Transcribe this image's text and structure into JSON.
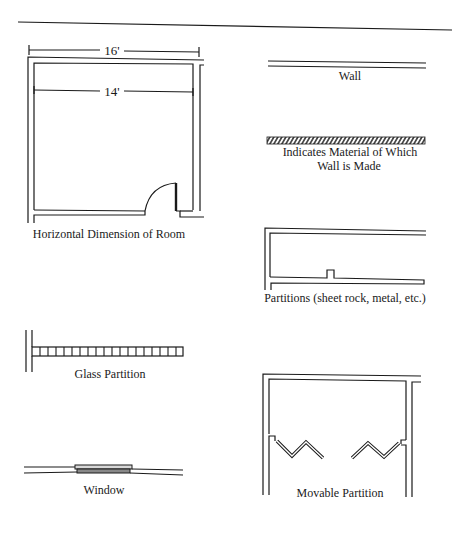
{
  "diagram": {
    "symbols": [
      {
        "id": "room",
        "label": "Horizontal Dimension of Room",
        "dimensions": {
          "outer": "16'",
          "inner": "14'"
        }
      },
      {
        "id": "wall",
        "label": "Wall"
      },
      {
        "id": "wall-material",
        "label_line1": "Indicates Material of Which",
        "label_line2": "Wall is Made"
      },
      {
        "id": "partitions",
        "label": "Partitions (sheet rock, metal, etc.)"
      },
      {
        "id": "glass-partition",
        "label": "Glass Partition"
      },
      {
        "id": "window",
        "label": "Window"
      },
      {
        "id": "movable-partition",
        "label": "Movable Partition"
      }
    ]
  },
  "colors": {
    "ink": "#1a1a1a",
    "background": "#ffffff"
  }
}
